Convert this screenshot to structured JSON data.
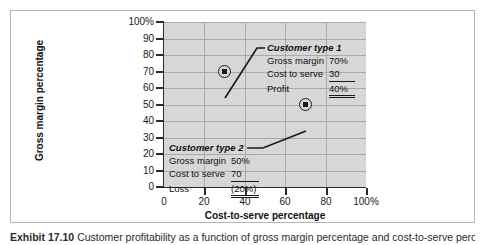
{
  "figure": {
    "caption_label": "Exhibit 17.10",
    "caption_text": "Customer profitability as a function of gross margin percentage and cost-to-serve percentage"
  },
  "chart_data": {
    "type": "scatter",
    "title": "",
    "xlabel": "Cost-to-serve percentage",
    "ylabel": "Gross margin percentage",
    "xlim": [
      0,
      100
    ],
    "ylim": [
      0,
      100
    ],
    "grid": true,
    "legend_position": "none",
    "xticks": [
      "0",
      "20",
      "40",
      "60",
      "80",
      "100%"
    ],
    "xtick_values": [
      0,
      20,
      40,
      60,
      80,
      100
    ],
    "yticks": [
      "0",
      "10",
      "20",
      "30",
      "40",
      "50",
      "60",
      "70",
      "80",
      "90",
      "100%"
    ],
    "ytick_values": [
      0,
      10,
      20,
      30,
      40,
      50,
      60,
      70,
      80,
      90,
      100
    ],
    "points": [
      {
        "name": "Customer type 1",
        "x": 30,
        "y": 70
      },
      {
        "name": "Customer type 2",
        "x": 70,
        "y": 50
      }
    ],
    "annotations": [
      {
        "title": "Customer type 1",
        "rows": [
          {
            "label": "Gross margin",
            "value": "70%",
            "rule": "none"
          },
          {
            "label": "Cost to serve",
            "value": "30",
            "rule": "single"
          },
          {
            "label": "Profit",
            "value": "40%",
            "rule": "double"
          }
        ]
      },
      {
        "title": "Customer type 2",
        "rows": [
          {
            "label": "Gross margin",
            "value": "50%",
            "rule": "none"
          },
          {
            "label": "Cost to serve",
            "value": "70",
            "rule": "single"
          },
          {
            "label": "Loss",
            "value": "(20%)",
            "rule": "double"
          }
        ]
      }
    ],
    "colors": {
      "plot_background": "#d7d7d7",
      "gridline": "#a9a9a9",
      "axis": "#2b2b2b",
      "marker": "#1a1a1a",
      "frame": "#b4b4b4"
    }
  }
}
